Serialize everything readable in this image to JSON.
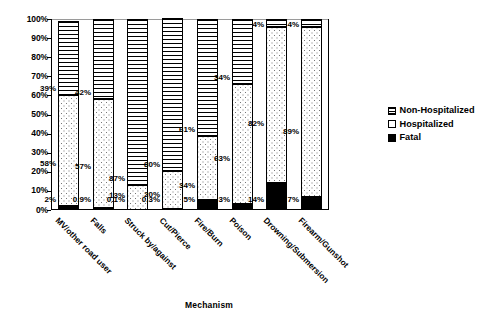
{
  "chart_data": {
    "type": "bar",
    "subtype": "stacked-bar-100-percent",
    "title": "",
    "xlabel": "Mechanism",
    "ylabel": "",
    "ylim": [
      0,
      100
    ],
    "grid": false,
    "legend_position": "right",
    "categories": [
      "MV/other road user",
      "Falls",
      "Struck by/against",
      "Cut/Pierce",
      "Fire/Burn",
      "Poison",
      "Drowning/Submersion",
      "Firearm/Gunshot"
    ],
    "ytick_labels": [
      "100%",
      "90%",
      "80%",
      "70%",
      "60%",
      "50%",
      "40%",
      "30%",
      "20%",
      "10%",
      "0%"
    ],
    "ytick_values": [
      100,
      90,
      80,
      70,
      60,
      50,
      40,
      30,
      20,
      10,
      0
    ],
    "series": [
      {
        "name": "Non-Hospitalized",
        "values": [
          39,
          42,
          87,
          80,
          61,
          34,
          4,
          4
        ],
        "labels": [
          "39%",
          "42%",
          "87%",
          "80%",
          "61%",
          "34%",
          "4%",
          "4%"
        ],
        "fill": "horizontal-lines"
      },
      {
        "name": "Hospitalized",
        "values": [
          58,
          57,
          13,
          20,
          34,
          63,
          82,
          89
        ],
        "labels": [
          "58%",
          "57%",
          "13%",
          "20%",
          "34%",
          "63%",
          "82%",
          "89%"
        ],
        "fill": "dotted"
      },
      {
        "name": "Fatal",
        "values": [
          2,
          0.9,
          0.1,
          0.3,
          5,
          3,
          14,
          7
        ],
        "labels": [
          "2%",
          "0.9%",
          "0.1%",
          "0.3%",
          "5%",
          "3%",
          "14%",
          "7%"
        ],
        "fill": "solid-black"
      }
    ]
  },
  "legend": {
    "items": [
      {
        "label": "Non-Hospitalized",
        "swatch": "hatched-square"
      },
      {
        "label": "Hospitalized",
        "swatch": "empty-square"
      },
      {
        "label": "Fatal",
        "swatch": "filled-square"
      }
    ]
  },
  "axis": {
    "x_title": "Mechanism"
  },
  "colors": {
    "axis": "#000000",
    "fatal": "#000000",
    "background": "#ffffff",
    "top_rule": "#9a9a9a"
  }
}
